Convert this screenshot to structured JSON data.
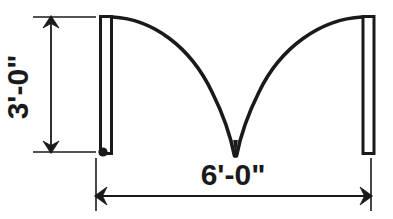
{
  "drawing": {
    "title": "arched-opening-elevation",
    "colors": {
      "stroke": "#1a1a1a",
      "background": "#ffffff",
      "dimension": "#1a1a1a"
    },
    "dimensions": {
      "height": {
        "label": "3'-0\"",
        "orientation": "vertical",
        "feet": 3,
        "inches": 0
      },
      "width": {
        "label": "6'-0\"",
        "orientation": "horizontal",
        "feet": 6,
        "inches": 0
      }
    },
    "geometry": {
      "left_jamb": {
        "x": 99,
        "y": 15,
        "width": 14,
        "height": 140
      },
      "right_jamb": {
        "x": 362,
        "y": 15,
        "width": 13,
        "height": 140
      },
      "pivot_dot": {
        "cx": 103.5,
        "cy": 152,
        "r": 4.5
      },
      "arch_apex": {
        "x": 235,
        "y": 157
      },
      "left_curve": "M 113 16 C 168 20, 214 72, 233 150 L 237 150 C 256 72, 302 20, 361 16",
      "arch_note": "double-ogee valley arch spanning between jambs"
    },
    "annotations": {
      "vertical_dim_line_x": 51,
      "vertical_dim_top_y": 18,
      "vertical_dim_bottom_y": 152,
      "horizontal_dim_line_y": 196,
      "horizontal_dim_left_x": 96,
      "horizontal_dim_right_x": 371
    }
  }
}
